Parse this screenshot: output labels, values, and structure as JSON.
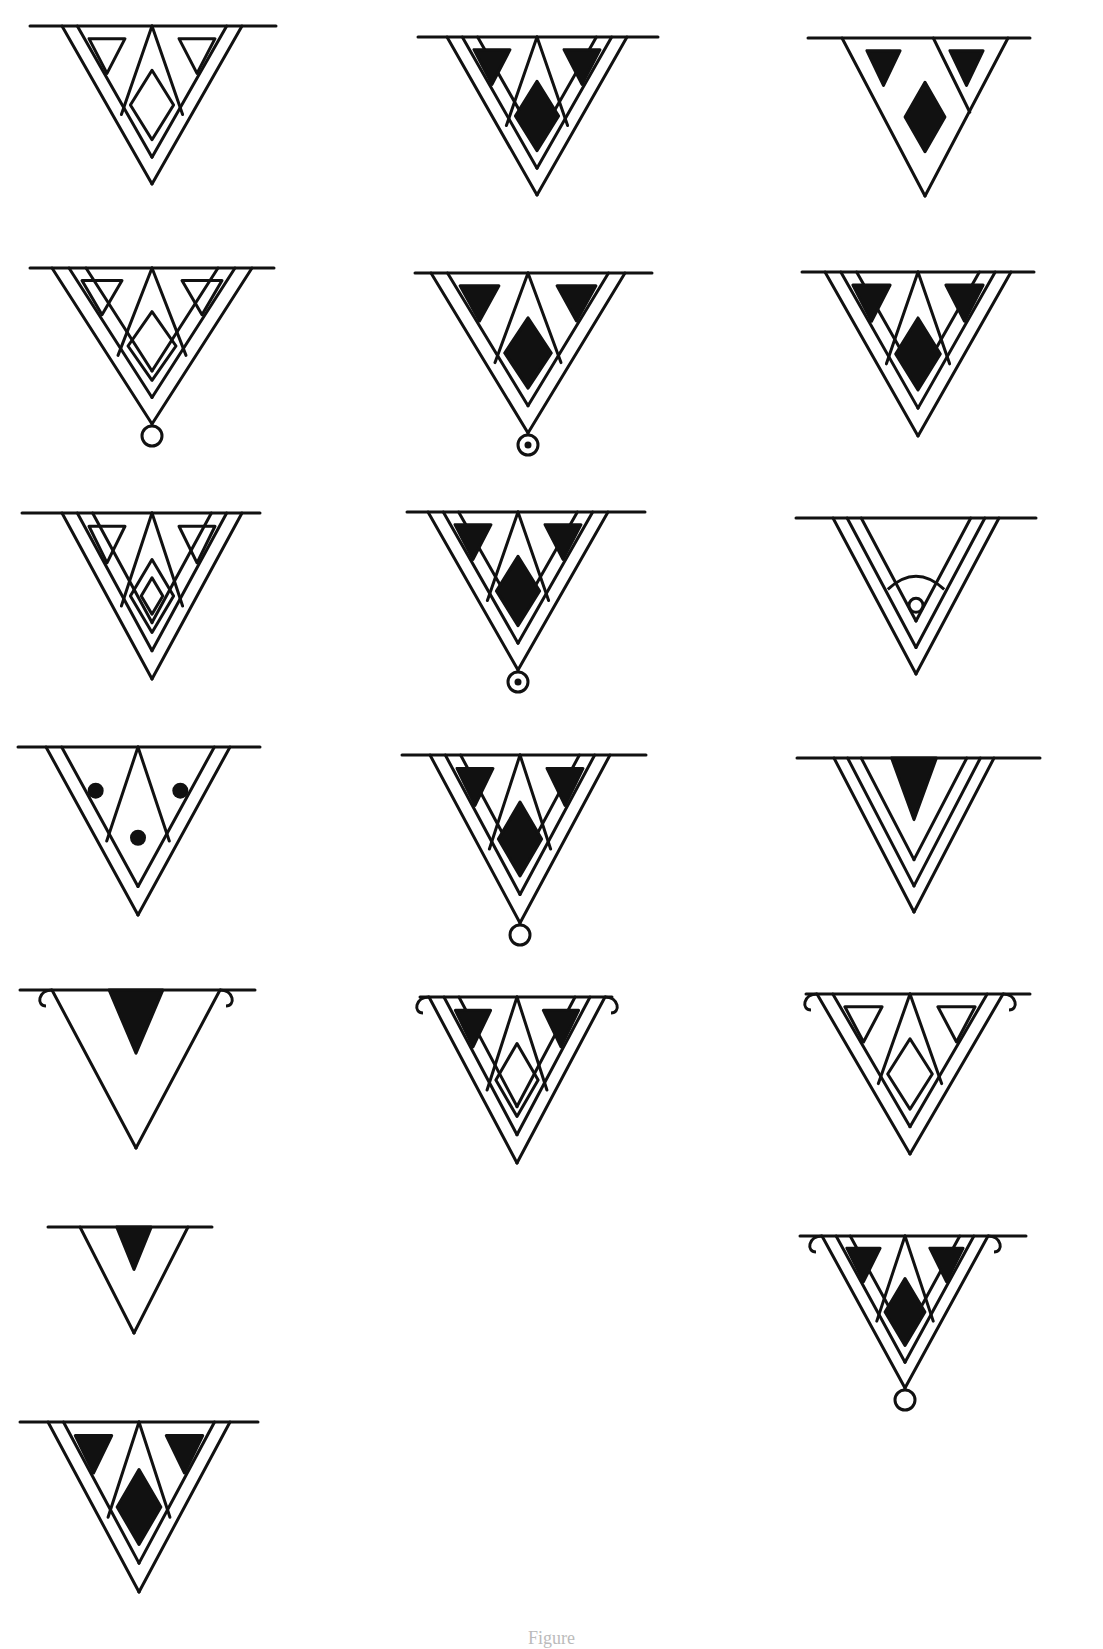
{
  "figure": {
    "caption": "Figure",
    "colors": {
      "ink": "#111111",
      "paper": "#ffffff"
    },
    "layout": {
      "columns": 3,
      "rows": 7,
      "motif_count": 17
    }
  },
  "motifs": [
    {
      "id": 1,
      "row": 1,
      "col": 1,
      "cx": 152,
      "top": 26,
      "bar": [
        30,
        276
      ],
      "w": 180,
      "h": 158,
      "bands": 1,
      "side_triangles": "outline",
      "center": "diamond-outline",
      "ornaments": [],
      "pendant": "none"
    },
    {
      "id": 2,
      "row": 1,
      "col": 2,
      "cx": 537,
      "top": 37,
      "bar": [
        418,
        658
      ],
      "w": 180,
      "h": 158,
      "bands": 2,
      "side_triangles": "solid",
      "center": "diamond-solid",
      "ornaments": [],
      "pendant": "none"
    },
    {
      "id": 3,
      "row": 1,
      "col": 3,
      "cx": 925,
      "top": 38,
      "bar": [
        808,
        1030
      ],
      "w": 166,
      "h": 158,
      "bands": 1,
      "side_triangles": "solid",
      "center": "diamond-solid",
      "ornaments": [
        "asymmetric-right-inner-line"
      ],
      "pendant": "none"
    },
    {
      "id": 4,
      "row": 2,
      "col": 1,
      "cx": 152,
      "top": 268,
      "bar": [
        30,
        274
      ],
      "w": 200,
      "h": 156,
      "bands": 2,
      "side_triangles": "outline",
      "center": "diamond-outline",
      "ornaments": [],
      "pendant": "ring"
    },
    {
      "id": 5,
      "row": 2,
      "col": 2,
      "cx": 528,
      "top": 273,
      "bar": [
        415,
        652
      ],
      "w": 194,
      "h": 160,
      "bands": 1,
      "side_triangles": "solid",
      "center": "diamond-solid",
      "ornaments": [],
      "pendant": "ring-dot"
    },
    {
      "id": 6,
      "row": 2,
      "col": 3,
      "cx": 918,
      "top": 272,
      "bar": [
        802,
        1034
      ],
      "w": 186,
      "h": 164,
      "bands": 2,
      "side_triangles": "solid",
      "center": "diamond-solid",
      "ornaments": [],
      "pendant": "none"
    },
    {
      "id": 7,
      "row": 3,
      "col": 1,
      "cx": 152,
      "top": 513,
      "bar": [
        22,
        260
      ],
      "w": 180,
      "h": 166,
      "bands": 2,
      "side_triangles": "outline",
      "center": "double-diamond-outline",
      "ornaments": [],
      "pendant": "none"
    },
    {
      "id": 8,
      "row": 3,
      "col": 2,
      "cx": 518,
      "top": 512,
      "bar": [
        407,
        645
      ],
      "w": 180,
      "h": 158,
      "bands": 2,
      "side_triangles": "solid",
      "center": "diamond-solid",
      "ornaments": [],
      "pendant": "ring-dot"
    },
    {
      "id": 9,
      "row": 3,
      "col": 3,
      "cx": 916,
      "top": 518,
      "bar": [
        796,
        1036
      ],
      "w": 166,
      "h": 156,
      "bands": 2,
      "side_triangles": "none",
      "center": "arc-ring",
      "ornaments": [],
      "pendant": "none"
    },
    {
      "id": 10,
      "row": 4,
      "col": 1,
      "cx": 138,
      "top": 747,
      "bar": [
        18,
        260
      ],
      "w": 184,
      "h": 168,
      "bands": 1,
      "side_triangles": "dot",
      "center": "dot",
      "ornaments": [],
      "pendant": "none"
    },
    {
      "id": 11,
      "row": 4,
      "col": 2,
      "cx": 520,
      "top": 755,
      "bar": [
        402,
        646
      ],
      "w": 180,
      "h": 168,
      "bands": 2,
      "side_triangles": "solid",
      "center": "diamond-solid",
      "ornaments": [],
      "pendant": "ring"
    },
    {
      "id": 12,
      "row": 4,
      "col": 3,
      "cx": 914,
      "top": 758,
      "bar": [
        797,
        1040
      ],
      "w": 160,
      "h": 154,
      "bands": 2,
      "side_triangles": "none",
      "center": "top-wedge-solid",
      "ornaments": [],
      "pendant": "none"
    },
    {
      "id": 13,
      "row": 5,
      "col": 1,
      "cx": 136,
      "top": 990,
      "bar": [
        20,
        255
      ],
      "w": 168,
      "h": 158,
      "bands": 0,
      "side_triangles": "none",
      "center": "top-wedge-solid",
      "ornaments": [
        "curls"
      ],
      "pendant": "none"
    },
    {
      "id": 14,
      "row": 5,
      "col": 2,
      "cx": 517,
      "top": 997,
      "bar": [
        420,
        612
      ],
      "w": 176,
      "h": 166,
      "bands": 2,
      "side_triangles": "solid",
      "center": "diamond-outline",
      "ornaments": [
        "curls"
      ],
      "pendant": "none"
    },
    {
      "id": 15,
      "row": 5,
      "col": 3,
      "cx": 910,
      "top": 994,
      "bar": [
        806,
        1030
      ],
      "w": 186,
      "h": 160,
      "bands": 1,
      "side_triangles": "outline",
      "center": "diamond-outline",
      "ornaments": [
        "curls"
      ],
      "pendant": "none"
    },
    {
      "id": 16,
      "row": 6,
      "col": 1,
      "cx": 134,
      "top": 1227,
      "bar": [
        48,
        212
      ],
      "w": 108,
      "h": 106,
      "bands": 0,
      "side_triangles": "none",
      "center": "top-wedge-solid",
      "ornaments": [],
      "pendant": "none"
    },
    {
      "id": 17,
      "row": 6,
      "col": 3,
      "cx": 905,
      "top": 1236,
      "bar": [
        800,
        1026
      ],
      "w": 166,
      "h": 152,
      "bands": 2,
      "side_triangles": "solid",
      "center": "diamond-solid",
      "ornaments": [
        "curls"
      ],
      "pendant": "ring"
    },
    {
      "id": 18,
      "row": 7,
      "col": 1,
      "cx": 139,
      "top": 1422,
      "bar": [
        20,
        258
      ],
      "w": 182,
      "h": 170,
      "bands": 1,
      "side_triangles": "solid",
      "center": "diamond-solid",
      "ornaments": [],
      "pendant": "none"
    }
  ]
}
